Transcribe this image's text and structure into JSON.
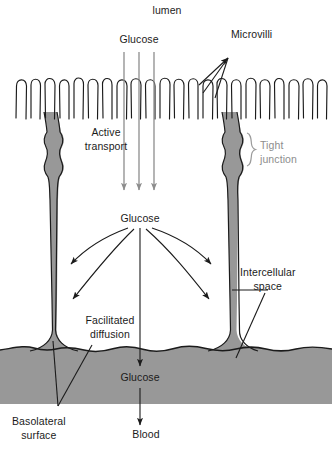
{
  "figure": {
    "type": "biological-diagram",
    "width": 332,
    "height": 452
  },
  "colors": {
    "cell_fill": "#989898",
    "outline": "#1b1b1b",
    "gray_arrow": "#8d8d8d",
    "gray_text": "#8d8d8d",
    "background": "#ffffff"
  },
  "labels": {
    "lumen": "lumen",
    "glucose_top": "Glucose",
    "microvilli": "Microvilli",
    "active_transport_line1": "Active",
    "active_transport_line2": "transport",
    "tight_junction_line1": "Tight",
    "tight_junction_line2": "junction",
    "glucose_mid": "Glucose",
    "intercellular_line1": "Intercellular",
    "intercellular_line2": "space",
    "facilitated_line1": "Facilitated",
    "facilitated_line2": "diffusion",
    "glucose_bottom": "Glucose",
    "basolateral_line1": "Basolateral",
    "basolateral_line2": "surface",
    "blood": "Blood"
  },
  "structures": {
    "microvilli_count": 30,
    "epithelial_cell_count": 1,
    "transport_arrows_top": 3,
    "diffusion_arrows": 5
  }
}
